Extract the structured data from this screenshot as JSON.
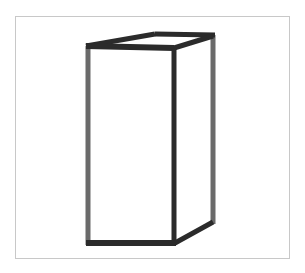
{
  "figure": {
    "colors": {
      "front_edges": "#2b2b2b",
      "back_edges": "#6a6a6a",
      "frame_border": "#c8c8c8",
      "background": "#ffffff"
    },
    "vertices": {
      "front_top_left": [
        88,
        46
      ],
      "front_top_right": [
        174,
        48
      ],
      "front_bottom_left": [
        88,
        243
      ],
      "front_bottom_right": [
        174,
        243
      ],
      "back_top_left": [
        155,
        34
      ],
      "back_top_right": [
        213,
        35
      ],
      "back_bottom_right": [
        213,
        223
      ]
    }
  }
}
